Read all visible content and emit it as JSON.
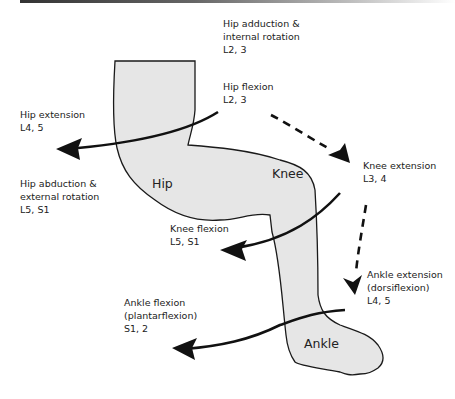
{
  "diagram": {
    "regions": {
      "hip": "Hip",
      "knee": "Knee",
      "ankle": "Ankle"
    },
    "labels": {
      "hip_adduction": {
        "line1": "Hip adduction &",
        "line2": "internal rotation",
        "line3": "L2, 3"
      },
      "hip_flexion": {
        "line1": "Hip flexion",
        "line2": "L2, 3"
      },
      "hip_extension": {
        "line1": "Hip extension",
        "line2": "L4, 5"
      },
      "hip_abduction": {
        "line1": "Hip abduction &",
        "line2": "external rotation",
        "line3": "L5, S1"
      },
      "knee_extension": {
        "line1": "Knee extension",
        "line2": "L3, 4"
      },
      "knee_flexion": {
        "line1": "Knee flexion",
        "line2": "L5, S1"
      },
      "ankle_extension": {
        "line1": "Ankle extension",
        "line2": "(dorsiflexion)",
        "line3": "L4, 5"
      },
      "ankle_flexion": {
        "line1": "Ankle flexion",
        "line2": "(plantarflexion)",
        "line3": "S1, 2"
      }
    },
    "colors": {
      "leg_fill": "#e6e6e6",
      "outline": "#1a1a1a"
    }
  }
}
